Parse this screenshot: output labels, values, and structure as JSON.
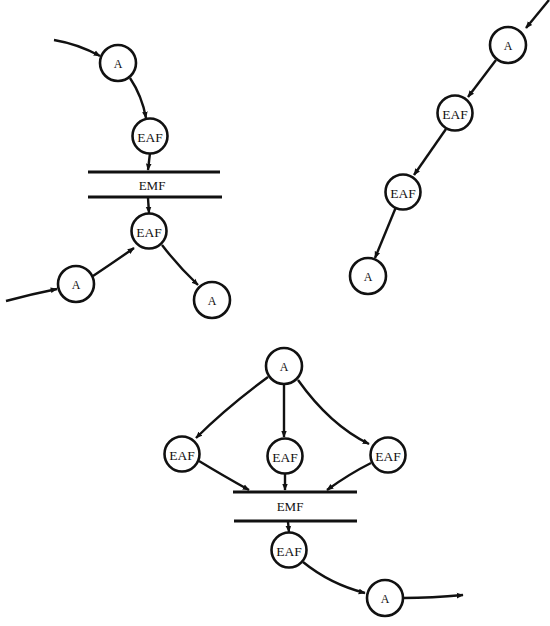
{
  "diagram": {
    "colors": {
      "ink": "#111111",
      "background": "#ffffff"
    },
    "panels": [
      {
        "id": "panel-top-left",
        "nodes": [
          {
            "id": "tl-a1",
            "label": "A"
          },
          {
            "id": "tl-eaf1",
            "label": "EAF"
          },
          {
            "id": "tl-eaf2",
            "label": "EAF"
          },
          {
            "id": "tl-a2",
            "label": "A"
          },
          {
            "id": "tl-a3",
            "label": "A"
          }
        ],
        "bars": [
          {
            "id": "tl-emf",
            "label": "EMF"
          }
        ],
        "edges": [
          {
            "from": "external-in",
            "to": "tl-a1"
          },
          {
            "from": "tl-a1",
            "to": "tl-eaf1"
          },
          {
            "from": "tl-eaf1",
            "to": "tl-emf"
          },
          {
            "from": "tl-emf",
            "to": "tl-eaf2"
          },
          {
            "from": "external-in",
            "to": "tl-a2"
          },
          {
            "from": "tl-a2",
            "to": "tl-eaf2"
          },
          {
            "from": "tl-eaf2",
            "to": "tl-a3"
          }
        ]
      },
      {
        "id": "panel-top-right",
        "nodes": [
          {
            "id": "tr-a1",
            "label": "A"
          },
          {
            "id": "tr-eaf1",
            "label": "EAF"
          },
          {
            "id": "tr-eaf2",
            "label": "EAF"
          },
          {
            "id": "tr-a2",
            "label": "A"
          }
        ],
        "bars": [],
        "edges": [
          {
            "from": "external-in",
            "to": "tr-a1"
          },
          {
            "from": "tr-a1",
            "to": "tr-eaf1"
          },
          {
            "from": "tr-eaf1",
            "to": "tr-eaf2"
          },
          {
            "from": "tr-eaf2",
            "to": "tr-a2"
          }
        ]
      },
      {
        "id": "panel-bottom",
        "nodes": [
          {
            "id": "b-a1",
            "label": "A"
          },
          {
            "id": "b-eaf-left",
            "label": "EAF"
          },
          {
            "id": "b-eaf-mid",
            "label": "EAF"
          },
          {
            "id": "b-eaf-right",
            "label": "EAF"
          },
          {
            "id": "b-eaf-out",
            "label": "EAF"
          },
          {
            "id": "b-a2",
            "label": "A"
          }
        ],
        "bars": [
          {
            "id": "b-emf",
            "label": "EMF"
          }
        ],
        "edges": [
          {
            "from": "b-a1",
            "to": "b-eaf-left"
          },
          {
            "from": "b-a1",
            "to": "b-eaf-mid"
          },
          {
            "from": "b-a1",
            "to": "b-eaf-right"
          },
          {
            "from": "b-eaf-left",
            "to": "b-emf"
          },
          {
            "from": "b-eaf-mid",
            "to": "b-emf"
          },
          {
            "from": "b-eaf-right",
            "to": "b-emf"
          },
          {
            "from": "b-emf",
            "to": "b-eaf-out"
          },
          {
            "from": "b-eaf-out",
            "to": "b-a2"
          },
          {
            "from": "b-a2",
            "to": "external-out"
          }
        ]
      }
    ]
  }
}
